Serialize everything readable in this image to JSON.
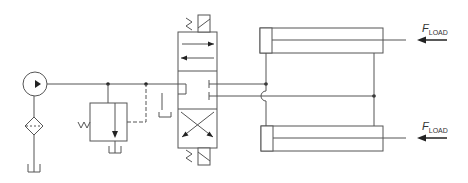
{
  "diagram": {
    "line_color": "#555555",
    "components": {
      "pump": {
        "name": "Pump"
      },
      "filter": {
        "name": "Filter"
      },
      "tank": {
        "name": "Tank / Reservoir"
      },
      "relief_valve": {
        "name": "Pressure relief valve"
      },
      "directional_valve": {
        "name": "4/3 solenoid-operated directional control valve, spring centered"
      },
      "cylinder_top": {
        "name": "Double-acting cylinder (top)"
      },
      "cylinder_bottom": {
        "name": "Double-acting cylinder (bottom)"
      }
    },
    "labels": {
      "load_top": {
        "main": "F",
        "sub": "LOAD"
      },
      "load_bottom": {
        "main": "F",
        "sub": "LOAD"
      }
    }
  }
}
